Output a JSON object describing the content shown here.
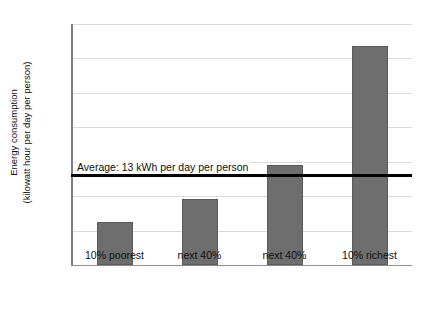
{
  "chart_data": {
    "type": "bar",
    "title": "",
    "xlabel": "",
    "ylabel": "Energy consumption (kilowatt hour per day per person)",
    "ylabel_lines": [
      "Energy consumption",
      "(kilowatt hour per day per person)"
    ],
    "categories": [
      "10% poorest",
      "next 40%",
      "next 40%",
      "10% richest"
    ],
    "values": [
      6.2,
      9.6,
      14.5,
      31.8
    ],
    "ylim": [
      0,
      35
    ],
    "ytick_step": 5,
    "yticks": [
      "0",
      "5",
      "10",
      "15",
      "20",
      "25",
      "30",
      "35"
    ],
    "grid": true,
    "legend": "none",
    "bar_color": "#6e6e6e",
    "bar_edge_color": "#5a5a5a",
    "gridline_color": "#d9d9d9",
    "annotations": [
      {
        "name": "average-line",
        "text": "Average: 13 kWh per day per person",
        "value": 13,
        "color": "#000000"
      }
    ]
  }
}
